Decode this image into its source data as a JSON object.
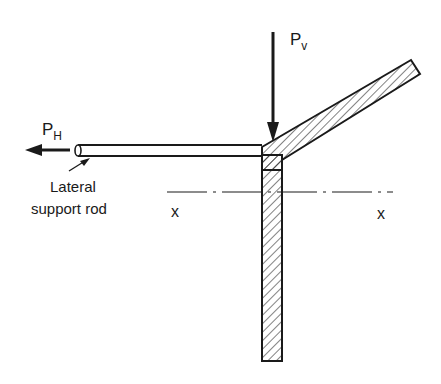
{
  "diagram": {
    "title": "",
    "labels": {
      "vertical_load": "P",
      "vertical_load_sub": "v",
      "horizontal_load": "P",
      "horizontal_load_sub": "H",
      "rod_label_line1": "Lateral",
      "rod_label_line2": "support rod",
      "axis_left": "x",
      "axis_right": "x"
    },
    "colors": {
      "ink": "#1a1a1a",
      "background": "#ffffff"
    },
    "components": [
      {
        "name": "vertical-column",
        "description": "Hatched vertical member"
      },
      {
        "name": "inclined-arm",
        "description": "Hatched inclined member rising to the right"
      },
      {
        "name": "lateral-support-rod",
        "description": "Horizontal rod attached to joint"
      },
      {
        "name": "centroidal-axis",
        "description": "Dash-dot line x-x"
      },
      {
        "name": "vertical-force-arrow",
        "description": "Downward load Pv at joint"
      },
      {
        "name": "horizontal-force-arrow",
        "description": "Leftward load PH at rod end"
      }
    ]
  }
}
